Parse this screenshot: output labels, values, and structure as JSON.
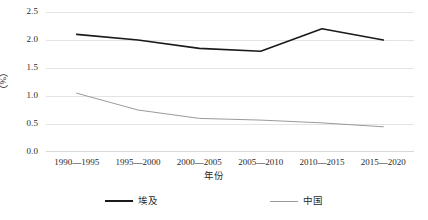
{
  "chart_data": {
    "type": "line",
    "title": "",
    "xlabel": "年份",
    "ylabel": "（%）",
    "categories": [
      "1990—1995",
      "1995—2000",
      "2000—2005",
      "2005—2010",
      "2010—2015",
      "2015—2020"
    ],
    "series": [
      {
        "name": "埃及",
        "color": "#1a1a1a",
        "line_width": 1.6,
        "values": [
          2.1,
          2.0,
          1.85,
          1.8,
          2.2,
          2.0
        ]
      },
      {
        "name": "中国",
        "color": "#9a9a9a",
        "line_width": 1.0,
        "values": [
          1.05,
          0.75,
          0.6,
          0.57,
          0.52,
          0.45
        ]
      }
    ],
    "ylim": [
      0.0,
      2.5
    ],
    "ytick_labels": [
      "2.5",
      "2.0",
      "1.5",
      "1.0",
      "0.5",
      "0.0"
    ],
    "ytick_values": [
      2.5,
      2.0,
      1.5,
      1.0,
      0.5,
      0.0
    ],
    "grid": true,
    "grid_axis": "y",
    "grid_color": "#e3e3e3",
    "legend_position": "bottom",
    "background": "#ffffff"
  }
}
